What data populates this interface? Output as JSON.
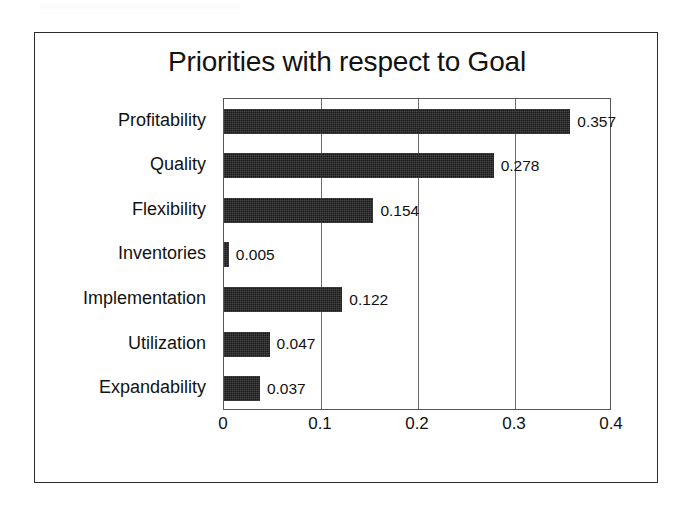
{
  "chart_data": {
    "type": "bar",
    "orientation": "horizontal",
    "title": "Priorities with respect to Goal",
    "xlabel": "",
    "ylabel": "",
    "categories": [
      "Profitability",
      "Quality",
      "Flexibility",
      "Inventories",
      "Implementation",
      "Utilization",
      "Expandability"
    ],
    "values": [
      0.357,
      0.278,
      0.154,
      0.005,
      0.122,
      0.047,
      0.037
    ],
    "value_labels": [
      "0.357",
      "0.278",
      "0.154",
      "0.005",
      "0.122",
      "0.047",
      "0.037"
    ],
    "xlim": [
      0,
      0.4
    ],
    "xticks": [
      0,
      0.1,
      0.2,
      0.3,
      0.4
    ],
    "xtick_labels": [
      "0",
      "0.1",
      "0.2",
      "0.3",
      "0.4"
    ],
    "gridlines": [
      0.1,
      0.2,
      0.3
    ],
    "grid": true,
    "legend": false,
    "legend_position": "none",
    "bar_color": "#1a1a1a",
    "plot_border_color": "#555555",
    "frame_border_color": "#2b2b2b",
    "background_color": "#ffffff",
    "data_labels_shown": true
  }
}
